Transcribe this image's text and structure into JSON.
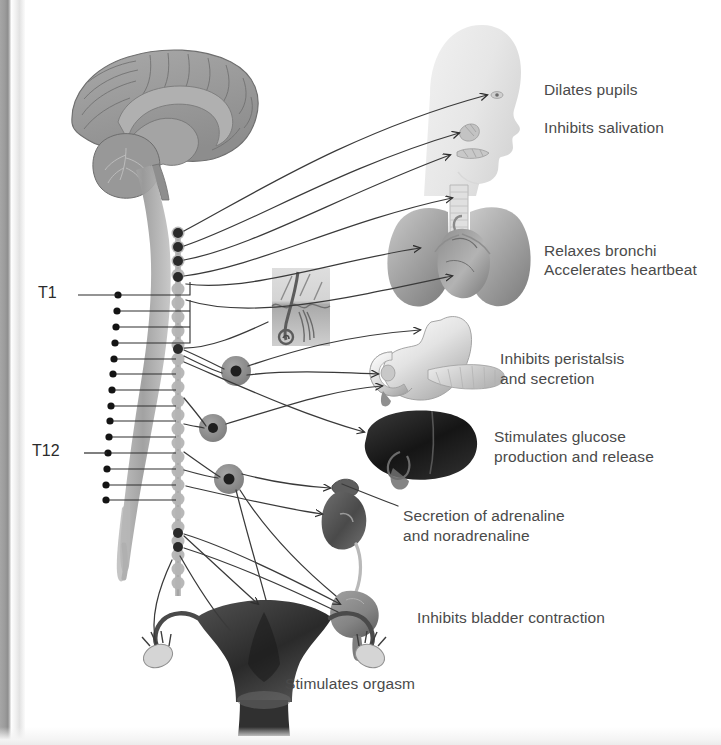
{
  "figure": {
    "background_color": "#ffffff",
    "label_color": "#4a4a4a",
    "segment_label_color": "#2b2b2b",
    "nerve_line_color": "#3a3a3a"
  },
  "spinal_segments": [
    {
      "id": "t1",
      "label": "T1",
      "x": 38,
      "y": 288,
      "leader_x1": 78,
      "leader_x2": 118,
      "leader_y": 295
    },
    {
      "id": "t12",
      "label": "T12",
      "x": 32,
      "y": 446,
      "leader_x1": 84,
      "leader_x2": 118,
      "leader_y": 453
    }
  ],
  "target_labels": [
    {
      "id": "dilates-pupils",
      "text": "Dilates pupils",
      "x": 544,
      "y": 80
    },
    {
      "id": "inhibits-salivation",
      "text": "Inhibits salivation",
      "x": 544,
      "y": 118
    },
    {
      "id": "relaxes-bronchi",
      "text": "Relaxes bronchi",
      "x": 544,
      "y": 241
    },
    {
      "id": "accelerates-heartbeat",
      "text": "Accelerates heartbeat",
      "x": 544,
      "y": 262
    },
    {
      "id": "inhibits-peristalsis",
      "text": "Inhibits peristalsis\nand secretion",
      "x": 500,
      "y": 350
    },
    {
      "id": "stimulates-glucose",
      "text": "Stimulates glucose\nproduction and release",
      "x": 494,
      "y": 428
    },
    {
      "id": "secretion-adrenaline",
      "text": "Secretion of adrenaline\nand noradrenaline",
      "x": 403,
      "y": 507
    },
    {
      "id": "inhibits-bladder",
      "text": "Inhibits bladder contraction",
      "x": 417,
      "y": 608
    },
    {
      "id": "stimulates-orgasm",
      "text": "Stimulates orgasm",
      "x": 285,
      "y": 674
    }
  ],
  "anatomy": {
    "brain": {
      "name": "brain-sagittal",
      "cx": 163,
      "cy": 120
    },
    "spinal_cord": {
      "name": "spinal-cord",
      "top_y": 150,
      "bottom_y": 575
    },
    "sympathetic_chain": {
      "name": "sympathetic-chain",
      "x": 178,
      "top_y": 228,
      "bottom_y": 596,
      "bead_count": 26
    },
    "head": {
      "name": "head-silhouette",
      "x": 418,
      "y": 22
    },
    "lungs_heart": {
      "name": "lungs-and-heart",
      "x": 378,
      "y": 185
    },
    "skin_inset": {
      "name": "skin-hair-follicle-inset",
      "x": 272,
      "y": 268
    },
    "stomach": {
      "name": "stomach-duodenum-pancreas",
      "x": 360,
      "y": 312
    },
    "liver": {
      "name": "liver",
      "x": 368,
      "y": 414
    },
    "kidney": {
      "name": "kidney-and-adrenal-gland",
      "x": 333,
      "y": 482
    },
    "bladder": {
      "name": "urinary-bladder",
      "x": 340,
      "y": 595
    },
    "uterus": {
      "name": "uterus-ovaries-fallopian-tubes",
      "x": 158,
      "y": 592
    },
    "prevertebral_ganglia": [
      {
        "name": "celiac-ganglion",
        "cx": 236,
        "cy": 371,
        "r": 15
      },
      {
        "name": "superior-mesenteric-ganglion",
        "cx": 213,
        "cy": 428,
        "r": 14
      },
      {
        "name": "inferior-mesenteric-ganglion",
        "cx": 229,
        "cy": 479,
        "r": 15
      }
    ]
  }
}
